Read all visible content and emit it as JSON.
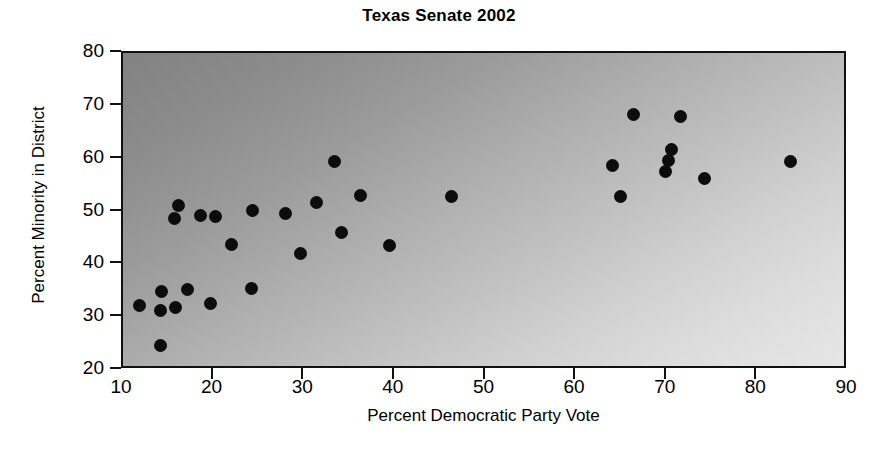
{
  "chart_data": {
    "type": "scatter",
    "title": "Texas Senate 2002",
    "xlabel": "Percent Democratic Party Vote",
    "ylabel": "Percent Minority in District",
    "xlim": [
      10,
      90
    ],
    "ylim": [
      20,
      80
    ],
    "xticks": [
      10,
      20,
      30,
      40,
      50,
      60,
      70,
      80,
      90
    ],
    "yticks": [
      20,
      30,
      40,
      50,
      60,
      70,
      80
    ],
    "xtick_labels": [
      "10",
      "20",
      "30",
      "40",
      "50",
      "60",
      "70",
      "80",
      "90"
    ],
    "ytick_labels": [
      "20",
      "30",
      "40",
      "50",
      "60",
      "70",
      "80"
    ],
    "grid": false,
    "legend": null,
    "marker": "filled-circle",
    "marker_color": "#0c0c0c",
    "plot_background": "gradient-gray-diagonal",
    "background_from": "#828282",
    "background_to": "#e6e6e6",
    "points": [
      {
        "x": 11.8,
        "y": 32.2
      },
      {
        "x": 14.1,
        "y": 24.7
      },
      {
        "x": 14.1,
        "y": 31.2
      },
      {
        "x": 14.2,
        "y": 34.8
      },
      {
        "x": 15.7,
        "y": 48.6
      },
      {
        "x": 15.8,
        "y": 31.9
      },
      {
        "x": 16.1,
        "y": 51.2
      },
      {
        "x": 17.1,
        "y": 35.3
      },
      {
        "x": 18.6,
        "y": 49.2
      },
      {
        "x": 19.6,
        "y": 32.6
      },
      {
        "x": 20.2,
        "y": 49.1
      },
      {
        "x": 22.0,
        "y": 43.7
      },
      {
        "x": 24.2,
        "y": 35.4
      },
      {
        "x": 24.3,
        "y": 50.1
      },
      {
        "x": 27.9,
        "y": 49.7
      },
      {
        "x": 29.6,
        "y": 42.0
      },
      {
        "x": 31.3,
        "y": 51.7
      },
      {
        "x": 33.3,
        "y": 59.5
      },
      {
        "x": 34.1,
        "y": 46.1
      },
      {
        "x": 36.2,
        "y": 53.1
      },
      {
        "x": 39.4,
        "y": 43.5
      },
      {
        "x": 46.3,
        "y": 52.9
      },
      {
        "x": 64.0,
        "y": 58.8
      },
      {
        "x": 64.9,
        "y": 52.9
      },
      {
        "x": 66.3,
        "y": 68.4
      },
      {
        "x": 69.9,
        "y": 57.6
      },
      {
        "x": 70.2,
        "y": 59.6
      },
      {
        "x": 70.5,
        "y": 61.7
      },
      {
        "x": 71.5,
        "y": 68.0
      },
      {
        "x": 74.2,
        "y": 56.3
      },
      {
        "x": 83.7,
        "y": 59.5
      }
    ]
  }
}
